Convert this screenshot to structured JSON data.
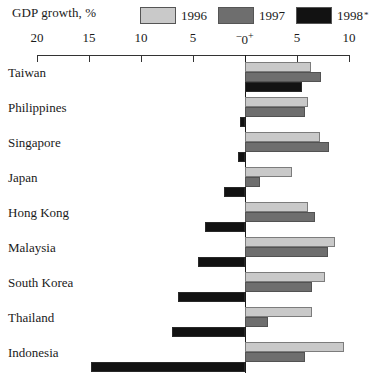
{
  "chart": {
    "title": "GDP growth, %",
    "footnote_marker": "*"
  },
  "legend": {
    "position": "top-right",
    "items": [
      {
        "label": "1996",
        "color": "#c9c9c9"
      },
      {
        "label": "1997",
        "color": "#6e6e6e"
      },
      {
        "label": "1998",
        "color": "#121212"
      }
    ]
  },
  "axis": {
    "zero_minus": "–",
    "zero_plus": "+",
    "zero_label": "0",
    "ticks": [
      {
        "label": "20",
        "value": -20
      },
      {
        "label": "15",
        "value": -15
      },
      {
        "label": "10",
        "value": -10
      },
      {
        "label": "5",
        "value": -5
      },
      {
        "label": "0",
        "value": 0
      },
      {
        "label": "5",
        "value": 5
      },
      {
        "label": "10",
        "value": 10
      }
    ]
  },
  "chart_data": {
    "type": "bar",
    "orientation": "horizontal",
    "title": "GDP growth, %",
    "xlabel": "GDP growth, %",
    "ylabel": "",
    "xlim": [
      -20,
      10
    ],
    "grid": false,
    "legend_position": "top-right",
    "categories": [
      "Taiwan",
      "Philippines",
      "Singapore",
      "Japan",
      "Hong Kong",
      "Malaysia",
      "South Korea",
      "Thailand",
      "Indonesia"
    ],
    "series": [
      {
        "name": "1996",
        "color": "#c9c9c9",
        "values": [
          6.3,
          6.1,
          7.2,
          4.5,
          6.1,
          8.7,
          7.7,
          6.4,
          9.5
        ]
      },
      {
        "name": "1997",
        "color": "#6e6e6e",
        "values": [
          7.3,
          5.8,
          8.1,
          1.4,
          6.7,
          8.0,
          6.4,
          2.2,
          5.8
        ]
      },
      {
        "name": "1998",
        "color": "#121212",
        "values": [
          5.5,
          -0.5,
          -0.7,
          -2.0,
          -3.8,
          -4.5,
          -6.4,
          -7.0,
          -14.8
        ]
      }
    ],
    "annotations": [
      "* 1998 figures are estimates"
    ]
  }
}
